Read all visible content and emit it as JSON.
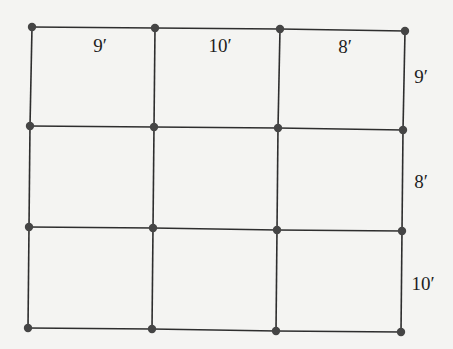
{
  "diagram": {
    "type": "grid-graph",
    "colors": {
      "background": "#f4f4f2",
      "edge": "#2e2e2e",
      "vertex": "#454545",
      "label": "#1e1e1e"
    },
    "vertices": [
      [
        [
          32,
          27
        ],
        [
          155,
          28
        ],
        [
          280,
          29
        ],
        [
          405,
          31
        ]
      ],
      [
        [
          30,
          126
        ],
        [
          154,
          127
        ],
        [
          278,
          128
        ],
        [
          403,
          130
        ]
      ],
      [
        [
          29,
          227
        ],
        [
          153,
          228
        ],
        [
          277,
          230
        ],
        [
          402,
          231
        ]
      ],
      [
        [
          28,
          328
        ],
        [
          152,
          329
        ],
        [
          276,
          331
        ],
        [
          401,
          332
        ]
      ]
    ],
    "column_widths": [
      "9′",
      "10′",
      "8′"
    ],
    "row_heights": [
      "9′",
      "8′",
      "10′"
    ],
    "labels": [
      {
        "id": "top-col-1",
        "text": "9′",
        "x": 100,
        "y": 45
      },
      {
        "id": "top-col-2",
        "text": "10′",
        "x": 220,
        "y": 45
      },
      {
        "id": "top-col-3",
        "text": "8′",
        "x": 345,
        "y": 46
      },
      {
        "id": "right-row-1",
        "text": "9′",
        "x": 421,
        "y": 76
      },
      {
        "id": "right-row-2",
        "text": "8′",
        "x": 421,
        "y": 181
      },
      {
        "id": "right-row-3",
        "text": "10′",
        "x": 423,
        "y": 283
      }
    ]
  }
}
